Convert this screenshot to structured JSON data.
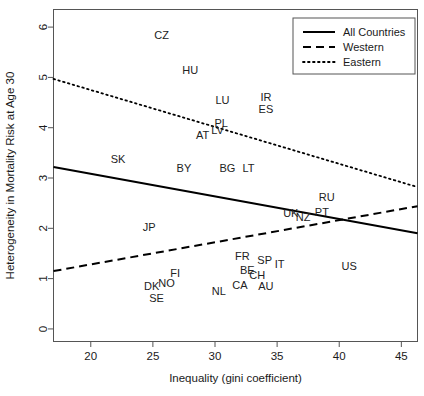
{
  "chart_data": {
    "type": "scatter",
    "title": "",
    "xlabel": "Inequality (gini coefficient)",
    "ylabel": "Heterogeneity in Mortality Risk at Age 30",
    "xlim": [
      17.0,
      46.3
    ],
    "ylim": [
      -0.25,
      6.35
    ],
    "xticks": [
      20,
      25,
      30,
      35,
      40,
      45
    ],
    "yticks": [
      0,
      1,
      2,
      3,
      4,
      5,
      6
    ],
    "grid": false,
    "legend_position": "top-right",
    "point_label_mode": "text-only",
    "points": [
      {
        "label": "CZ",
        "x": 25.7,
        "y": 5.85
      },
      {
        "label": "HU",
        "x": 28.0,
        "y": 5.15
      },
      {
        "label": "LU",
        "x": 30.6,
        "y": 4.55
      },
      {
        "label": "IR",
        "x": 34.1,
        "y": 4.62
      },
      {
        "label": "ES",
        "x": 34.1,
        "y": 4.38
      },
      {
        "label": "PL",
        "x": 30.5,
        "y": 4.1
      },
      {
        "label": "LV",
        "x": 30.2,
        "y": 3.95
      },
      {
        "label": "AT",
        "x": 29.0,
        "y": 3.86
      },
      {
        "label": "SK",
        "x": 22.2,
        "y": 3.38
      },
      {
        "label": "BY",
        "x": 27.5,
        "y": 3.2
      },
      {
        "label": "BG",
        "x": 31.0,
        "y": 3.2
      },
      {
        "label": "LT",
        "x": 32.7,
        "y": 3.2
      },
      {
        "label": "RU",
        "x": 39.0,
        "y": 2.62
      },
      {
        "label": "UK",
        "x": 36.1,
        "y": 2.31
      },
      {
        "label": "NZ",
        "x": 37.1,
        "y": 2.23
      },
      {
        "label": "PT",
        "x": 38.6,
        "y": 2.33
      },
      {
        "label": "JP",
        "x": 24.7,
        "y": 2.02
      },
      {
        "label": "FR",
        "x": 32.2,
        "y": 1.45
      },
      {
        "label": "SP",
        "x": 34.0,
        "y": 1.38
      },
      {
        "label": "IT",
        "x": 35.2,
        "y": 1.3
      },
      {
        "label": "US",
        "x": 40.8,
        "y": 1.26
      },
      {
        "label": "BE",
        "x": 32.6,
        "y": 1.18
      },
      {
        "label": "CH",
        "x": 33.4,
        "y": 1.08
      },
      {
        "label": "FI",
        "x": 26.8,
        "y": 1.12
      },
      {
        "label": "NO",
        "x": 26.1,
        "y": 0.92
      },
      {
        "label": "DK",
        "x": 24.9,
        "y": 0.86
      },
      {
        "label": "CA",
        "x": 32.0,
        "y": 0.88
      },
      {
        "label": "AU",
        "x": 34.1,
        "y": 0.86
      },
      {
        "label": "NL",
        "x": 30.3,
        "y": 0.76
      },
      {
        "label": "SE",
        "x": 25.3,
        "y": 0.62
      }
    ],
    "series": [
      {
        "name": "All Countries",
        "style": "solid",
        "color": "#000000",
        "line": {
          "x1": 17.0,
          "y1": 3.22,
          "x2": 46.3,
          "y2": 1.9
        }
      },
      {
        "name": "Western",
        "style": "dashed",
        "color": "#000000",
        "line": {
          "x1": 17.0,
          "y1": 1.15,
          "x2": 46.3,
          "y2": 2.44
        }
      },
      {
        "name": "Eastern",
        "style": "dotted",
        "color": "#000000",
        "line": {
          "x1": 17.0,
          "y1": 4.97,
          "x2": 46.3,
          "y2": 2.82
        }
      }
    ],
    "legend": [
      {
        "label": "All Countries",
        "style": "solid"
      },
      {
        "label": "Western",
        "style": "dashed"
      },
      {
        "label": "Eastern",
        "style": "dotted"
      }
    ]
  }
}
